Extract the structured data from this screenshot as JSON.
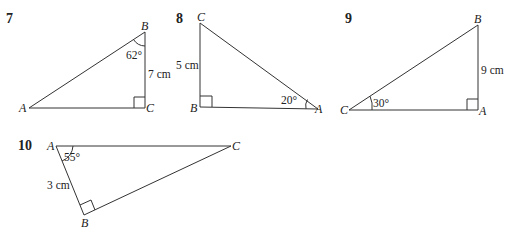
{
  "problems": [
    {
      "number": "7",
      "vertices": {
        "A": "A",
        "B": "B",
        "C": "C"
      },
      "angle_label": "62°",
      "side_label": "7 cm",
      "right_angle_at": "C"
    },
    {
      "number": "8",
      "vertices": {
        "A": "A",
        "B": "B",
        "C": "C"
      },
      "angle_label": "20°",
      "side_label": "5 cm",
      "right_angle_at": "B"
    },
    {
      "number": "9",
      "vertices": {
        "A": "A",
        "B": "B",
        "C": "C"
      },
      "angle_label": "30°",
      "side_label": "9 cm",
      "right_angle_at": "A"
    },
    {
      "number": "10",
      "vertices": {
        "A": "A",
        "B": "B",
        "C": "C"
      },
      "angle_label": "55°",
      "side_label": "3 cm",
      "right_angle_at": "B"
    }
  ]
}
